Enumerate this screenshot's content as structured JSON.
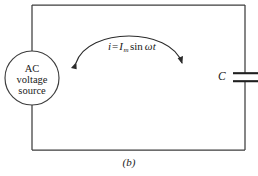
{
  "figure": {
    "caption": "(b)",
    "stroke_color": "#3d3d3d",
    "text_color": "#1a1a1a",
    "background": "#ffffff"
  },
  "source": {
    "name": "ac-voltage-source",
    "line1": "AC",
    "line2": "voltage",
    "line3": "source"
  },
  "current": {
    "symbol": "i",
    "equals": "=",
    "amplitude": "I",
    "amplitude_subscript": "m",
    "function": "sin",
    "omega_t": "ωt",
    "full_text": "i = I_m sin ωt"
  },
  "capacitor": {
    "label": "C",
    "name": "capacitor"
  },
  "arrow": {
    "name": "current-direction-arc",
    "style": "double-headed-arc"
  },
  "circuit": {
    "loop_name": "circuit-loop",
    "left_wire": "left-wire",
    "top_wire": "top-wire",
    "right_wire": "right-wire",
    "bottom_wire": "bottom-wire"
  }
}
